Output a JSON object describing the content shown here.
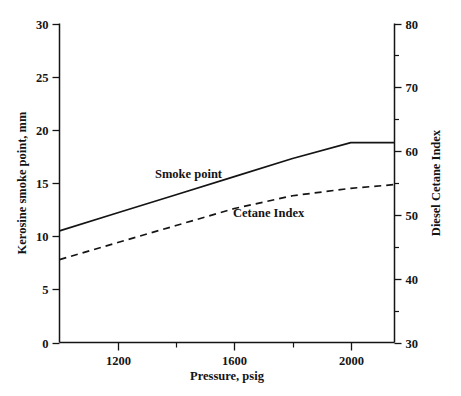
{
  "chart_data": {
    "type": "line",
    "title": "",
    "xlabel": "Pressure, psig",
    "ylabel": "Kerosine smoke point, mm",
    "y2label": "Diesel Cetane Index",
    "xlim": [
      1000,
      2150
    ],
    "ylim": [
      0,
      30
    ],
    "y2lim": [
      30,
      80
    ],
    "grid": false,
    "legend_position": "inline-annotation",
    "x_ticks": [
      1200,
      1600,
      2000
    ],
    "x_tick_labels": [
      "1200",
      "1600",
      "2000"
    ],
    "x_minor_ticks": [
      1400,
      1800
    ],
    "y_ticks": [
      0,
      5,
      10,
      15,
      20,
      25,
      30
    ],
    "y_tick_labels": [
      "0",
      "5",
      "10",
      "15",
      "20",
      "25",
      "30"
    ],
    "y2_ticks": [
      30,
      40,
      50,
      60,
      70,
      80
    ],
    "y2_tick_labels": [
      "30",
      "40",
      "50",
      "60",
      "70",
      "80"
    ],
    "y2_minor_ticks": [
      35,
      45,
      55,
      65,
      75
    ],
    "series": [
      {
        "name": "Smoke point",
        "style": "solid",
        "axis": "left",
        "units": "mm",
        "x": [
          1000,
          1200,
          1400,
          1600,
          1800,
          2000,
          2150
        ],
        "values": [
          10.5,
          12.2,
          13.9,
          15.6,
          17.3,
          18.8,
          18.8
        ]
      },
      {
        "name": "Cetane Index",
        "style": "dashed",
        "axis": "right",
        "units": "index",
        "x": [
          1000,
          1200,
          1400,
          1600,
          1800,
          2000,
          2150
        ],
        "values": [
          7.8,
          9.4,
          11.0,
          12.6,
          13.8,
          14.5,
          14.85
        ],
        "values_right_axis": [
          42.8,
          46.0,
          49.2,
          52.4,
          54.8,
          56.2,
          56.9
        ]
      }
    ],
    "annotations": [
      {
        "text": "Smoke point",
        "x_px": 155,
        "y_px": 178
      },
      {
        "text": "Cetane Index",
        "x_px": 233,
        "y_px": 217
      }
    ]
  },
  "axes": {
    "left_title": "Kerosine smoke point, mm",
    "right_title": "Diesel Cetane Index",
    "bottom_title": "Pressure, psig"
  },
  "colors": {
    "ink": "#141414",
    "background": "#ffffff"
  }
}
